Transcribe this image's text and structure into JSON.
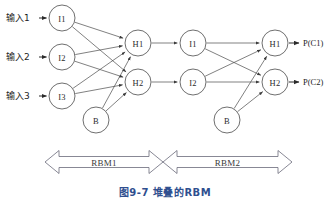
{
  "figure": {
    "caption": "图9-7  堆叠的RBM",
    "caption_color": "#2f4f8f",
    "background": "#ffffff",
    "stroke_color": "#4a4a4a"
  },
  "inputs": [
    {
      "label": "输入1",
      "x": 6,
      "y": 18
    },
    {
      "label": "输入2",
      "x": 6,
      "y": 57
    },
    {
      "label": "输入3",
      "x": 6,
      "y": 96
    }
  ],
  "outputs": [
    {
      "label": "P(C1)",
      "x": 303,
      "y": 43
    },
    {
      "label": "P(C2)",
      "x": 303,
      "y": 82
    }
  ],
  "nodes": [
    {
      "id": "rbm1-visible-1",
      "label": "I1",
      "cx": 62,
      "cy": 18,
      "r": 13
    },
    {
      "id": "rbm1-visible-2",
      "label": "I2",
      "cx": 62,
      "cy": 57,
      "r": 13
    },
    {
      "id": "rbm1-visible-3",
      "label": "I3",
      "cx": 62,
      "cy": 96,
      "r": 13
    },
    {
      "id": "rbm1-bias",
      "label": "B",
      "cx": 96,
      "cy": 120,
      "r": 13
    },
    {
      "id": "rbm1-hidden-1",
      "label": "H1",
      "cx": 138,
      "cy": 43,
      "r": 13
    },
    {
      "id": "rbm1-hidden-2",
      "label": "H2",
      "cx": 138,
      "cy": 82,
      "r": 13
    },
    {
      "id": "rbm2-visible-1",
      "label": "I1",
      "cx": 193,
      "cy": 43,
      "r": 13
    },
    {
      "id": "rbm2-visible-2",
      "label": "I2",
      "cx": 193,
      "cy": 82,
      "r": 13
    },
    {
      "id": "rbm2-bias",
      "label": "B",
      "cx": 227,
      "cy": 120,
      "r": 13
    },
    {
      "id": "rbm2-hidden-1",
      "label": "H1",
      "cx": 275,
      "cy": 43,
      "r": 13
    },
    {
      "id": "rbm2-hidden-2",
      "label": "H2",
      "cx": 275,
      "cy": 82,
      "r": 13
    }
  ],
  "edges": [
    {
      "from": "rbm1-visible-1",
      "to": "rbm1-hidden-1"
    },
    {
      "from": "rbm1-visible-1",
      "to": "rbm1-hidden-2"
    },
    {
      "from": "rbm1-visible-2",
      "to": "rbm1-hidden-1"
    },
    {
      "from": "rbm1-visible-2",
      "to": "rbm1-hidden-2"
    },
    {
      "from": "rbm1-visible-3",
      "to": "rbm1-hidden-1"
    },
    {
      "from": "rbm1-visible-3",
      "to": "rbm1-hidden-2"
    },
    {
      "from": "rbm1-bias",
      "to": "rbm1-hidden-1"
    },
    {
      "from": "rbm1-bias",
      "to": "rbm1-hidden-2"
    },
    {
      "from": "rbm1-hidden-1",
      "to": "rbm2-visible-1"
    },
    {
      "from": "rbm1-hidden-2",
      "to": "rbm2-visible-2"
    },
    {
      "from": "rbm2-visible-1",
      "to": "rbm2-hidden-1"
    },
    {
      "from": "rbm2-visible-1",
      "to": "rbm2-hidden-2"
    },
    {
      "from": "rbm2-visible-2",
      "to": "rbm2-hidden-1"
    },
    {
      "from": "rbm2-visible-2",
      "to": "rbm2-hidden-2"
    },
    {
      "from": "rbm2-bias",
      "to": "rbm2-hidden-1"
    },
    {
      "from": "rbm2-bias",
      "to": "rbm2-hidden-2"
    }
  ],
  "spans": [
    {
      "label": "RBM1",
      "x1": 45,
      "x2": 163,
      "y": 162
    },
    {
      "label": "RBM2",
      "x1": 163,
      "x2": 292,
      "y": 162
    }
  ]
}
